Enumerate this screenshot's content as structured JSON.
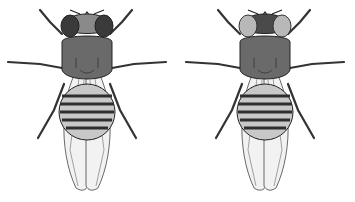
{
  "figure": {
    "flies": [
      {
        "position": "left",
        "eye_color": "#3a3a3a",
        "head_center_color": "#8a8a8a",
        "phenotype": "dark eyes"
      },
      {
        "position": "right",
        "eye_color": "#b8b8b8",
        "head_center_color": "#4a4a4a",
        "phenotype": "light eyes"
      }
    ],
    "colors": {
      "body": "#5e5e5e",
      "thorax": "#6a6a6a",
      "abdomen_light": "#c8c8c8",
      "abdomen_stripe": "#2e2e2e",
      "wing_fill": "#f2f2f2",
      "outline": "#222222",
      "background": "#ffffff"
    }
  }
}
